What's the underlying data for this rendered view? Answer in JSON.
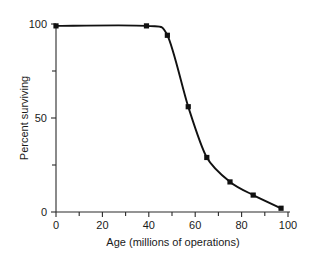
{
  "chart_data": {
    "type": "line",
    "title": "",
    "xlabel": "Age (millions of operations)",
    "ylabel": "Percent surviving",
    "xlim": [
      0,
      100
    ],
    "ylim": [
      0,
      100
    ],
    "grid": false,
    "legend": "none",
    "x_ticks_major": [
      0,
      20,
      40,
      60,
      80,
      100
    ],
    "x_tick_labels": [
      "0",
      "20",
      "40",
      "60",
      "80",
      "100"
    ],
    "x_ticks_minor": [
      10,
      30,
      50,
      70,
      90
    ],
    "y_ticks_major": [
      0,
      50,
      100
    ],
    "y_tick_labels": [
      "0",
      "50",
      "100"
    ],
    "y_ticks_minor": [
      25,
      75
    ],
    "series": [
      {
        "name": "Percent surviving",
        "marker": "filled-square",
        "x": [
          0,
          39,
          48,
          57,
          65,
          75,
          85,
          97
        ],
        "values": [
          99,
          99,
          94,
          56,
          29,
          16,
          9,
          2
        ]
      }
    ]
  },
  "axis_labels": {
    "x_title": "Age (millions of operations)",
    "y_title": "Percent surviving"
  },
  "colors": {
    "curve": "#111111",
    "axis": "#2a2a2a",
    "text": "#1a1a1a",
    "background": "#ffffff"
  }
}
